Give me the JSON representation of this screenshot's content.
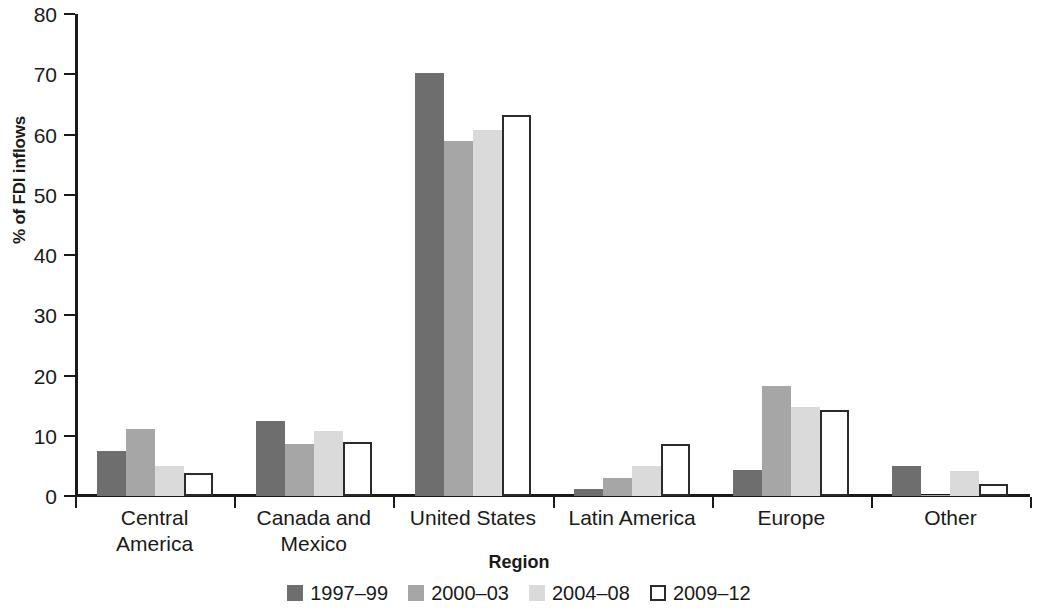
{
  "chart_data": {
    "type": "bar",
    "title": "",
    "subtitle": "",
    "xlabel": "Region",
    "ylabel": "% of FDI inflows",
    "ylim": [
      0,
      80
    ],
    "ytick_step": 10,
    "yticks": [
      0,
      10,
      20,
      30,
      40,
      50,
      60,
      70,
      80
    ],
    "grid": false,
    "legend_position": "bottom-center",
    "categories": [
      "Central America",
      "Canada and Mexico",
      "United States",
      "Latin America",
      "Europe",
      "Other"
    ],
    "category_lines": [
      [
        "Central",
        "America"
      ],
      [
        "Canada and",
        "Mexico"
      ],
      [
        "United States"
      ],
      [
        "Latin America"
      ],
      [
        "Europe"
      ],
      [
        "Other"
      ]
    ],
    "series": [
      {
        "name": "1997–99",
        "color": "#6e6e6e",
        "values": [
          7.5,
          12.4,
          70.2,
          1.2,
          4.3,
          5.0
        ]
      },
      {
        "name": "2000–03",
        "color": "#a6a6a6",
        "values": [
          11.1,
          8.7,
          59.0,
          3.0,
          18.3,
          0.2
        ]
      },
      {
        "name": "2004–08",
        "color": "#dadada",
        "values": [
          5.0,
          10.8,
          60.8,
          4.9,
          14.8,
          4.2
        ]
      },
      {
        "name": "2009–12",
        "color": "#ffffff",
        "outline": "#2b2b2b",
        "values": [
          3.9,
          9.0,
          63.3,
          8.6,
          14.3,
          2.0
        ]
      }
    ]
  },
  "axes": {
    "y_title": "% of FDI inflows",
    "x_title": "Region"
  },
  "legend": {
    "items": [
      {
        "label": "1997–99"
      },
      {
        "label": "2000–03"
      },
      {
        "label": "2004–08"
      },
      {
        "label": "2009–12"
      }
    ]
  }
}
